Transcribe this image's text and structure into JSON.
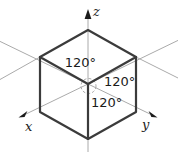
{
  "diagram": {
    "angle_labels": {
      "upper_left": "120°",
      "right": "120°",
      "lower": "120°"
    },
    "axes": {
      "x": "x",
      "y": "y",
      "z": "z"
    },
    "colors": {
      "background": "#ffffff",
      "cube_edge": "#3b3b3b",
      "axis_line": "#aaaaaa",
      "label_text": "#1b1b1b",
      "arrowhead": "#1b1b1b"
    }
  }
}
